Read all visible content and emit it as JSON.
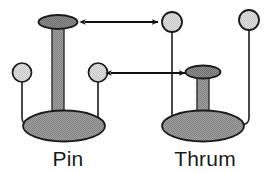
{
  "diagram": {
    "type": "botanical-diagram",
    "background_color": "#ffffff",
    "colors": {
      "stigma_fill": "#8a8a8a",
      "style_fill": "#9a9a9a",
      "ovary_fill": "#999999",
      "anther_fill": "#d9d9d9",
      "outline": "#1a1a1a",
      "filament": "#2b2b2b",
      "arrow": "#111111",
      "label_text": "#1a1a1a"
    },
    "flowers": [
      {
        "id": "pin",
        "label": "Pin",
        "label_x": 68,
        "label_y": 166,
        "morph": "long-style-short-stamens",
        "style": {
          "name": "long-style",
          "column_x": 58,
          "column_top": 26,
          "column_bottom": 120,
          "column_width": 12
        },
        "stigma": {
          "name": "stigma-high",
          "cx": 58,
          "cy": 22,
          "rx": 19,
          "ry": 6.5
        },
        "ovary": {
          "name": "ovary",
          "cx": 64,
          "cy": 126,
          "rx": 41,
          "ry": 15
        },
        "anthers": [
          {
            "name": "anther-left-low",
            "cx": 22,
            "cy": 73,
            "r": 9.5,
            "filament_x": 22,
            "filament_bottom": 124,
            "curve_to_x": 36
          },
          {
            "name": "anther-right-low",
            "cx": 98,
            "cy": 73,
            "r": 9.5,
            "filament_x": 98,
            "filament_bottom": 124,
            "curve_to_x": 88
          }
        ]
      },
      {
        "id": "thrum",
        "label": "Thrum",
        "label_x": 205,
        "label_y": 166,
        "morph": "short-style-long-stamens",
        "style": {
          "name": "short-style",
          "column_x": 203,
          "column_top": 76,
          "column_bottom": 120,
          "column_width": 12
        },
        "stigma": {
          "name": "stigma-low",
          "cx": 203,
          "cy": 72,
          "rx": 17,
          "ry": 6
        },
        "ovary": {
          "name": "ovary",
          "cx": 203,
          "cy": 126,
          "rx": 41,
          "ry": 15
        },
        "anthers": [
          {
            "name": "anther-left-high",
            "cx": 172,
            "cy": 22,
            "r": 10,
            "filament_x": 172,
            "filament_bottom": 124,
            "curve_to_x": 182
          },
          {
            "name": "anther-right-high",
            "cx": 249,
            "cy": 20,
            "r": 10,
            "filament_x": 249,
            "filament_bottom": 124,
            "curve_to_x": 237
          }
        ]
      }
    ],
    "arrows": [
      {
        "name": "arrow-stigma-to-anther-upper",
        "description": "double-headed arrow linking pin stigma level to thrum anther level",
        "x1": 84,
        "x2": 159,
        "y": 22,
        "double_headed": true
      },
      {
        "name": "arrow-anther-to-stigma-lower",
        "description": "double-headed arrow linking pin anther level to thrum stigma level",
        "x1": 110,
        "x2": 186,
        "y": 73,
        "double_headed": true
      }
    ]
  }
}
